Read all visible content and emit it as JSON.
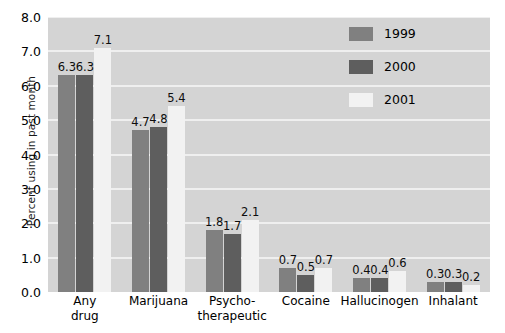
{
  "chart_data": {
    "type": "bar",
    "title": "",
    "subtitle": "",
    "xlabel": "",
    "ylabel": "Percent using in past month",
    "ylim": [
      0.0,
      8.0
    ],
    "ytick_step": 1.0,
    "ytick_labels": [
      "0.0",
      "1.0",
      "2.0",
      "3.0",
      "4.0",
      "5.0",
      "6.0",
      "7.0",
      "8.0"
    ],
    "categories": [
      "Any drug",
      "Marijuana",
      "Psycho-therapeutic",
      "Cocaine",
      "Hallucinogen",
      "Inhalant"
    ],
    "category_lines": [
      [
        "Any",
        "drug"
      ],
      [
        "Marijuana",
        ""
      ],
      [
        "Psycho-",
        "therapeutic"
      ],
      [
        "Cocaine",
        ""
      ],
      [
        "Hallucinogen",
        ""
      ],
      [
        "Inhalant",
        ""
      ]
    ],
    "series": [
      {
        "name": "1999",
        "color": "#808080",
        "values": [
          6.3,
          4.7,
          1.8,
          0.7,
          0.4,
          0.3
        ]
      },
      {
        "name": "2000",
        "color": "#5e5e5e",
        "values": [
          6.3,
          4.8,
          1.7,
          0.5,
          0.4,
          0.3
        ]
      },
      {
        "name": "2001",
        "color": "#f2f2f2",
        "values": [
          7.1,
          5.4,
          2.1,
          0.7,
          0.6,
          0.2
        ]
      }
    ],
    "value_labels": [
      [
        "6.3",
        "6.3",
        "7.1"
      ],
      [
        "4.7",
        "4.8",
        "5.4"
      ],
      [
        "1.8",
        "1.7",
        "2.1"
      ],
      [
        "0.7",
        "0.5",
        "0.7"
      ],
      [
        "0.4",
        "0.4",
        "0.6"
      ],
      [
        "0.3",
        "0.3",
        "0.2"
      ]
    ],
    "grid": true,
    "grid_color": "#efefef",
    "plot_background": "#d4d4d4",
    "legend_position": "top-right",
    "legend_entries": [
      "1999",
      "2000",
      "2001"
    ]
  }
}
